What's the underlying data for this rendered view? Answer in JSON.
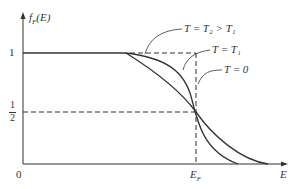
{
  "diagram": {
    "y_axis_label": "f_F(E)",
    "x_axis_label": "E",
    "origin_label": "0",
    "y_ticks": {
      "one": "1",
      "half_num": "1",
      "half_den": "2"
    },
    "x_ticks": {
      "fermi": "E_F"
    },
    "curves": [
      {
        "label": "T = T₂ > T₁",
        "style": "solid"
      },
      {
        "label": "T = T₁",
        "style": "solid"
      },
      {
        "label": "T = 0",
        "style": "dashed"
      }
    ],
    "colors": {
      "line": "#333333",
      "text": "#333333",
      "background": "#ffffff"
    }
  }
}
